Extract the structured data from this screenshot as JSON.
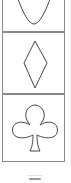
{
  "palette": {
    "items": [
      {
        "shape": "parabola-icon",
        "label": ""
      },
      {
        "shape": "diamond-icon",
        "label": ""
      },
      {
        "shape": "club-icon",
        "label": ""
      }
    ]
  },
  "colors": {
    "border": "#8a8a8a",
    "stroke": "#444444",
    "background": "#ffffff"
  }
}
